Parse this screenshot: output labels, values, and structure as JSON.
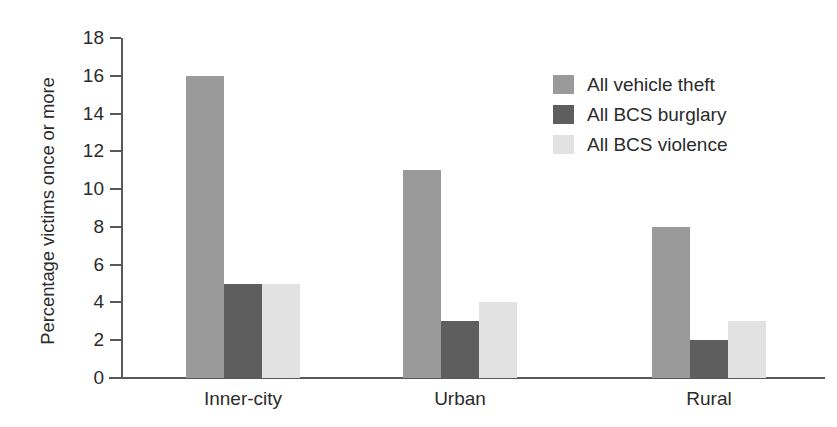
{
  "chart_data": {
    "type": "bar",
    "title": "",
    "xlabel": "",
    "ylabel": "Percentage victims once or more",
    "categories": [
      "Inner-city",
      "Urban",
      "Rural"
    ],
    "series": [
      {
        "name": "All vehicle theft",
        "color": "#9a9a9a",
        "values": [
          16,
          11,
          8
        ]
      },
      {
        "name": "All BCS burglary",
        "color": "#5e5e5e",
        "values": [
          5,
          3,
          2
        ]
      },
      {
        "name": "All BCS violence",
        "color": "#e2e2e2",
        "values": [
          5,
          4,
          3
        ]
      }
    ],
    "ylim": [
      0,
      18
    ],
    "y_ticks": [
      0,
      2,
      4,
      6,
      8,
      10,
      12,
      14,
      16,
      18
    ],
    "y_tick_labels": [
      "0",
      "2",
      "4",
      "6",
      "8",
      "10",
      "12",
      "14",
      "16",
      "18"
    ],
    "grid": false,
    "legend_position": "top-right",
    "axis_color": "#59595c",
    "background": "#ffffff"
  },
  "legend": {
    "entries": [
      {
        "label": "All vehicle theft",
        "swatch_name": "legend-swatch-vehicle-theft"
      },
      {
        "label": "All BCS burglary",
        "swatch_name": "legend-swatch-bcs-burglary"
      },
      {
        "label": "All BCS violence",
        "swatch_name": "legend-swatch-bcs-violence"
      }
    ]
  }
}
